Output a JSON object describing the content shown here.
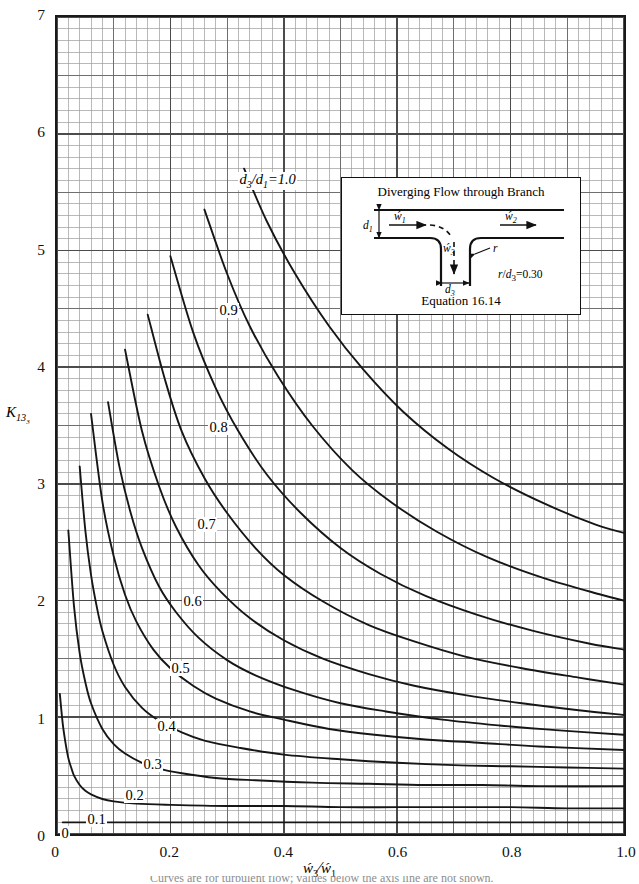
{
  "figure": {
    "y_axis_title": "K13 3",
    "x_axis_title": "w3 / w1",
    "y_ticks": [
      "0",
      "1",
      "2",
      "3",
      "4",
      "5",
      "6",
      "7"
    ],
    "x_ticks": [
      "0",
      "0.2",
      "0.4",
      "0.6",
      "0.8",
      "1.0"
    ],
    "grid": "on",
    "axis_color": "#1a1a1a",
    "major_grid_color": "#4b4b4b",
    "minor_grid_color": "#9a9a9a",
    "curve_color": "#161616"
  },
  "curve_labels": [
    {
      "text": "d3/d1=1.0",
      "x": 238,
      "y": 172,
      "italic": true
    },
    {
      "text": "0.9",
      "x": 218,
      "y": 303
    },
    {
      "text": "0.8",
      "x": 208,
      "y": 420
    },
    {
      "text": "0.7",
      "x": 196,
      "y": 517
    },
    {
      "text": "0.6",
      "x": 182,
      "y": 594
    },
    {
      "text": "0.5",
      "x": 170,
      "y": 661
    },
    {
      "text": "0.4",
      "x": 156,
      "y": 719
    },
    {
      "text": "0.3",
      "x": 142,
      "y": 757
    },
    {
      "text": "0.2",
      "x": 124,
      "y": 788
    },
    {
      "text": "0.1",
      "x": 86,
      "y": 812
    },
    {
      "text": "0",
      "x": 60,
      "y": 826
    }
  ],
  "inset": {
    "title": "Diverging Flow through Branch",
    "equation": "Equation 16.14",
    "ratio_label": "r/d3=0.30",
    "labels": {
      "d1": "d1",
      "d3": "d3",
      "w1": "w1",
      "w2": "w2",
      "w3": "w3",
      "r": "r"
    }
  },
  "bottom_caption": "Curves are for turbulent flow; values below the axis line are not shown.",
  "chart_data": {
    "type": "line",
    "title": "",
    "xlabel": "w3/w1",
    "ylabel": "K13_3",
    "xlim": [
      0,
      1.0
    ],
    "ylim": [
      0,
      7
    ],
    "xticks": [
      0,
      0.2,
      0.4,
      0.6,
      0.8,
      1.0
    ],
    "yticks": [
      0,
      1,
      2,
      3,
      4,
      5,
      6,
      7
    ],
    "minor_x_step": 0.02,
    "minor_y_step": 0.1,
    "grid": true,
    "legend": "inline curve labels (d3/d1 parameter)",
    "series": [
      {
        "name": "d3/d1=0",
        "x": [
          0.01,
          0.02,
          0.03,
          0.04,
          0.05,
          0.06,
          0.08,
          0.1,
          0.15,
          0.2,
          0.3,
          0.4,
          0.5,
          0.6,
          0.7,
          0.8,
          0.9,
          1.0
        ],
        "y": [
          0.1,
          0.1,
          0.1,
          0.1,
          0.1,
          0.1,
          0.1,
          0.1,
          0.1,
          0.1,
          0.1,
          0.1,
          0.1,
          0.1,
          0.1,
          0.1,
          0.1,
          0.1
        ]
      },
      {
        "name": "d3/d1=0.1",
        "x": [
          0.005,
          0.01,
          0.015,
          0.02,
          0.025,
          0.03,
          0.04,
          0.05,
          0.06,
          0.08,
          0.1,
          0.14,
          0.2,
          0.3,
          0.4,
          0.5,
          0.6,
          0.7,
          0.8,
          0.9,
          1.0
        ],
        "y": [
          1.2,
          0.95,
          0.78,
          0.65,
          0.57,
          0.5,
          0.42,
          0.37,
          0.34,
          0.3,
          0.28,
          0.26,
          0.25,
          0.24,
          0.24,
          0.23,
          0.23,
          0.23,
          0.23,
          0.22,
          0.22
        ]
      },
      {
        "name": "d3/d1=0.2",
        "x": [
          0.02,
          0.03,
          0.04,
          0.05,
          0.06,
          0.08,
          0.1,
          0.12,
          0.15,
          0.18,
          0.22,
          0.28,
          0.35,
          0.45,
          0.55,
          0.65,
          0.75,
          0.85,
          1.0
        ],
        "y": [
          2.6,
          1.95,
          1.55,
          1.3,
          1.12,
          0.9,
          0.77,
          0.69,
          0.61,
          0.56,
          0.52,
          0.48,
          0.46,
          0.44,
          0.43,
          0.42,
          0.42,
          0.41,
          0.41
        ]
      },
      {
        "name": "d3/d1=0.3",
        "x": [
          0.04,
          0.05,
          0.06,
          0.07,
          0.08,
          0.1,
          0.12,
          0.15,
          0.18,
          0.22,
          0.26,
          0.32,
          0.4,
          0.5,
          0.6,
          0.7,
          0.8,
          0.9,
          1.0
        ],
        "y": [
          3.15,
          2.6,
          2.22,
          1.95,
          1.74,
          1.45,
          1.26,
          1.08,
          0.97,
          0.87,
          0.8,
          0.74,
          0.68,
          0.64,
          0.61,
          0.59,
          0.58,
          0.57,
          0.56
        ]
      },
      {
        "name": "d3/d1=0.4",
        "x": [
          0.06,
          0.08,
          0.1,
          0.12,
          0.14,
          0.17,
          0.2,
          0.24,
          0.28,
          0.34,
          0.4,
          0.48,
          0.56,
          0.65,
          0.75,
          0.85,
          1.0
        ],
        "y": [
          3.6,
          2.85,
          2.38,
          2.05,
          1.82,
          1.58,
          1.42,
          1.27,
          1.16,
          1.05,
          0.98,
          0.9,
          0.85,
          0.81,
          0.78,
          0.75,
          0.72
        ]
      },
      {
        "name": "d3/d1=0.5",
        "x": [
          0.09,
          0.11,
          0.13,
          0.15,
          0.18,
          0.21,
          0.25,
          0.3,
          0.35,
          0.42,
          0.5,
          0.58,
          0.68,
          0.78,
          0.88,
          1.0
        ],
        "y": [
          3.7,
          3.15,
          2.75,
          2.45,
          2.12,
          1.9,
          1.68,
          1.49,
          1.36,
          1.23,
          1.12,
          1.05,
          0.98,
          0.93,
          0.89,
          0.85
        ]
      },
      {
        "name": "d3/d1=0.6",
        "x": [
          0.12,
          0.15,
          0.18,
          0.21,
          0.25,
          0.29,
          0.34,
          0.4,
          0.47,
          0.55,
          0.63,
          0.72,
          0.82,
          0.92,
          1.0
        ],
        "y": [
          4.15,
          3.45,
          2.98,
          2.63,
          2.3,
          2.07,
          1.85,
          1.66,
          1.5,
          1.37,
          1.27,
          1.19,
          1.12,
          1.06,
          1.02
        ]
      },
      {
        "name": "d3/d1=0.7",
        "x": [
          0.16,
          0.19,
          0.22,
          0.26,
          0.3,
          0.35,
          0.4,
          0.47,
          0.55,
          0.63,
          0.72,
          0.82,
          0.92,
          1.0
        ],
        "y": [
          4.45,
          3.9,
          3.45,
          3.05,
          2.75,
          2.45,
          2.22,
          1.99,
          1.79,
          1.65,
          1.52,
          1.42,
          1.34,
          1.28
        ]
      },
      {
        "name": "d3/d1=0.8",
        "x": [
          0.2,
          0.24,
          0.28,
          0.32,
          0.37,
          0.43,
          0.5,
          0.57,
          0.65,
          0.74,
          0.84,
          0.94,
          1.0
        ],
        "y": [
          4.95,
          4.3,
          3.82,
          3.45,
          3.08,
          2.75,
          2.45,
          2.23,
          2.04,
          1.88,
          1.74,
          1.63,
          1.58
        ]
      },
      {
        "name": "d3/d1=0.9",
        "x": [
          0.26,
          0.3,
          0.34,
          0.39,
          0.45,
          0.52,
          0.59,
          0.67,
          0.76,
          0.86,
          0.96,
          1.0
        ],
        "y": [
          5.35,
          4.8,
          4.35,
          3.92,
          3.5,
          3.12,
          2.84,
          2.59,
          2.37,
          2.19,
          2.05,
          2.0
        ]
      },
      {
        "name": "d3/d1=1.0",
        "x": [
          0.33,
          0.37,
          0.42,
          0.48,
          0.54,
          0.61,
          0.69,
          0.77,
          0.86,
          0.95,
          1.0
        ],
        "y": [
          5.7,
          5.25,
          4.8,
          4.35,
          3.98,
          3.62,
          3.3,
          3.05,
          2.83,
          2.65,
          2.58
        ]
      }
    ],
    "top_entry_curves_note": "Each curve also rises steeply to the top border (K=7) at small w3/w1."
  }
}
